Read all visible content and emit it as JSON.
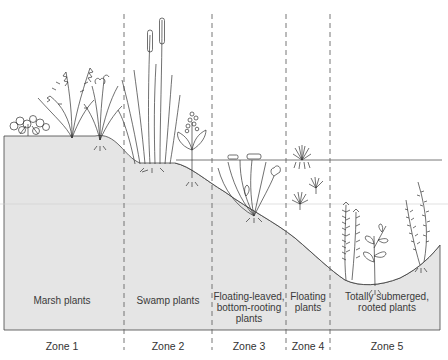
{
  "diagram": {
    "type": "cross-section",
    "colors": {
      "ground": "#e5e5e5",
      "ink": "#333333",
      "divider": "#666666",
      "background": "#ffffff"
    },
    "zones": [
      {
        "id": "zone-1",
        "zone_label": "Zone 1",
        "plant_type": "Marsh plants",
        "center_x": 62
      },
      {
        "id": "zone-2",
        "zone_label": "Zone 2",
        "plant_type": "Swamp plants",
        "center_x": 168
      },
      {
        "id": "zone-3",
        "zone_label": "Zone 3",
        "plant_type_lines": [
          "Floating-leaved,",
          "bottom-rooting",
          "plants"
        ],
        "center_x": 249
      },
      {
        "id": "zone-4",
        "zone_label": "Zone 4",
        "plant_type_lines": [
          "Floating",
          "plants"
        ],
        "center_x": 308
      },
      {
        "id": "zone-5",
        "zone_label": "Zone 5",
        "plant_type_lines": [
          "Totally submerged,",
          "rooted plants"
        ],
        "center_x": 387
      }
    ],
    "dividers_x": [
      124,
      212,
      286,
      330
    ]
  }
}
